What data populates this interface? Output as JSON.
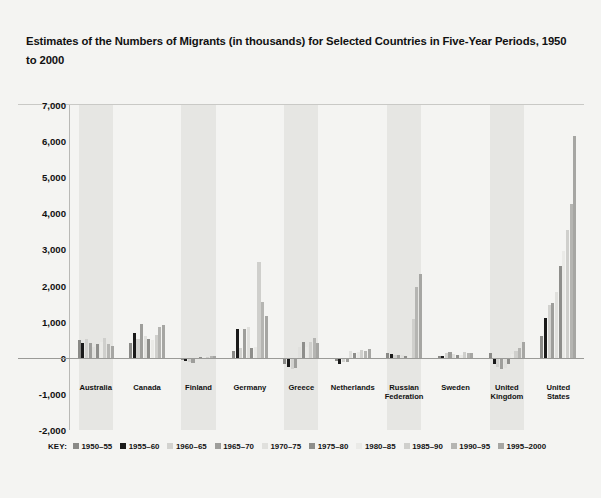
{
  "title": "Estimates of the Numbers of Migrants (in thousands) for Selected Countries in Five-Year Periods, 1950 to 2000",
  "legend": {
    "key_label": "KEY:"
  },
  "chart_data": {
    "type": "bar",
    "title": "Estimates of the Numbers of Migrants (in thousands) for Selected Countries in Five-Year Periods, 1950 to 2000",
    "xlabel": "",
    "ylabel": "",
    "ylim": [
      -2000,
      7000
    ],
    "yticks": [
      -2000,
      -1000,
      0,
      1000,
      2000,
      3000,
      4000,
      5000,
      6000,
      7000
    ],
    "ytick_labels": [
      "-2,000",
      "-1,000",
      "0",
      "1,000",
      "2,000",
      "3,000",
      "4,000",
      "5,000",
      "6,000",
      "7,000"
    ],
    "grid": false,
    "legend_position": "bottom",
    "categories": [
      "Australia",
      "Canada",
      "Finland",
      "Germany",
      "Greece",
      "Netherlands",
      "Russian Federation",
      "Sweden",
      "United Kingdom",
      "United States"
    ],
    "series": [
      {
        "name": "1950–55",
        "color": "#8a8a87",
        "values": [
          480,
          410,
          -60,
          190,
          -180,
          -90,
          120,
          60,
          140,
          600
        ]
      },
      {
        "name": "1955–60",
        "color": "#1a1a1a",
        "values": [
          420,
          700,
          -80,
          810,
          -250,
          -160,
          110,
          50,
          -180,
          1100
        ]
      },
      {
        "name": "1960–65",
        "color": "#d2d2cf",
        "values": [
          530,
          520,
          -110,
          260,
          -310,
          -110,
          90,
          130,
          -260,
          1450
        ]
      },
      {
        "name": "1965–70",
        "color": "#9e9e9b",
        "values": [
          410,
          930,
          -140,
          800,
          -290,
          -120,
          80,
          160,
          -300,
          1520
        ]
      },
      {
        "name": "1970–75",
        "color": "#e0e0dd",
        "values": [
          290,
          610,
          -40,
          860,
          300,
          180,
          70,
          110,
          -290,
          1820
        ]
      },
      {
        "name": "1975–80",
        "color": "#8e8e8b",
        "values": [
          390,
          520,
          30,
          270,
          430,
          120,
          60,
          90,
          -160,
          2550
        ]
      },
      {
        "name": "1980–85",
        "color": "#eaeae7",
        "values": [
          430,
          480,
          40,
          300,
          300,
          160,
          50,
          80,
          100,
          2950
        ]
      },
      {
        "name": "1985–90",
        "color": "#cfcfcc",
        "values": [
          560,
          620,
          20,
          2650,
          430,
          210,
          1080,
          150,
          180,
          3550
        ]
      },
      {
        "name": "1990–95",
        "color": "#b5b5b2",
        "values": [
          380,
          840,
          60,
          1540,
          560,
          190,
          1960,
          130,
          260,
          4250
        ]
      },
      {
        "name": "1995–2000",
        "color": "#a6a6a3",
        "values": [
          330,
          910,
          40,
          1150,
          420,
          230,
          2310,
          140,
          430,
          6150
        ]
      }
    ]
  }
}
